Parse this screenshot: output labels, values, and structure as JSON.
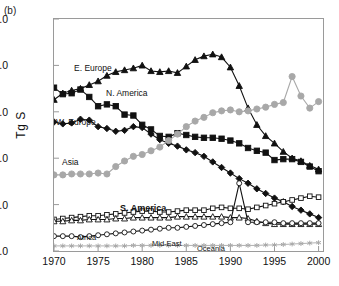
{
  "panel": {
    "label": "(b)"
  },
  "axes": {
    "ylabel": "Tg S",
    "xlabel": "",
    "yticks": [
      "0.0",
      "5.0",
      "10.0",
      "15.0",
      "20.0",
      "25.0"
    ],
    "xticks": [
      "1970",
      "1975",
      "1980",
      "1985",
      "1990",
      "1995",
      "2000"
    ]
  },
  "colors": {
    "black": "#111111",
    "gray": "#a8a8a8",
    "frame": "#9a9a9a",
    "white": "#ffffff"
  },
  "annotations": [
    {
      "text": "E. Europe",
      "x": 74,
      "y": 63
    },
    {
      "text": "N. America",
      "x": 106,
      "y": 88
    },
    {
      "text": "W. Europe",
      "x": 56,
      "y": 117
    },
    {
      "text": "Asia",
      "x": 62,
      "y": 157
    },
    {
      "text": "S. America",
      "x": 120,
      "y": 203
    },
    {
      "text": "Africa",
      "x": 77,
      "y": 233
    },
    {
      "text": "Mid-East",
      "x": 152,
      "y": 239
    },
    {
      "text": "Oceania",
      "x": 197,
      "y": 244
    }
  ],
  "chart_data": {
    "type": "line",
    "title": "",
    "xlabel": "",
    "ylabel": "Tg S",
    "xlim": [
      1970,
      2000.5
    ],
    "ylim": [
      0.0,
      25.0
    ],
    "grid": false,
    "legend": "inline-annotations",
    "x": [
      1970,
      1971,
      1972,
      1973,
      1974,
      1975,
      1976,
      1977,
      1978,
      1979,
      1980,
      1981,
      1982,
      1983,
      1984,
      1985,
      1986,
      1987,
      1988,
      1989,
      1990,
      1991,
      1992,
      1993,
      1994,
      1995,
      1996,
      1997,
      1998,
      1999,
      2000
    ],
    "series": [
      {
        "name": "E. Europe",
        "marker": "triangle",
        "color": "#111111",
        "fill": "#111111",
        "values": [
          16.3,
          17.0,
          17.3,
          17.5,
          17.9,
          18.3,
          18.9,
          19.3,
          19.5,
          19.7,
          20.0,
          19.4,
          19.3,
          19.4,
          19.2,
          19.9,
          20.6,
          21.0,
          21.2,
          20.9,
          19.8,
          17.8,
          15.4,
          13.6,
          12.4,
          11.6,
          10.7,
          10.0,
          9.7,
          9.2,
          8.8
        ]
      },
      {
        "name": "N. America",
        "marker": "square",
        "color": "#111111",
        "fill": "#111111",
        "values": [
          17.6,
          16.9,
          17.0,
          17.4,
          16.6,
          15.6,
          15.8,
          15.6,
          14.7,
          14.6,
          13.6,
          13.1,
          12.4,
          12.3,
          12.7,
          12.5,
          12.3,
          12.2,
          12.2,
          12.1,
          11.9,
          11.6,
          11.1,
          10.8,
          10.6,
          9.8,
          9.9,
          9.9,
          9.6,
          9.1,
          8.6
        ]
      },
      {
        "name": "W. Europe",
        "marker": "diamond",
        "color": "#111111",
        "fill": "#111111",
        "values": [
          13.9,
          13.7,
          13.8,
          14.2,
          14.1,
          13.4,
          13.2,
          12.9,
          13.0,
          13.4,
          13.3,
          12.6,
          12.0,
          11.6,
          11.3,
          10.9,
          10.6,
          10.2,
          9.6,
          9.0,
          8.4,
          7.8,
          7.3,
          6.7,
          6.2,
          5.7,
          5.3,
          4.8,
          4.4,
          4.0,
          3.6
        ]
      },
      {
        "name": "Asia",
        "marker": "circle",
        "color": "#a8a8a8",
        "fill": "#a8a8a8",
        "values": [
          8.2,
          8.2,
          8.3,
          8.3,
          8.3,
          8.4,
          8.3,
          9.1,
          9.7,
          10.2,
          10.4,
          10.8,
          11.2,
          11.9,
          12.6,
          13.4,
          14.0,
          14.4,
          14.9,
          15.1,
          15.2,
          15.0,
          15.1,
          15.3,
          15.5,
          15.8,
          16.0,
          18.8,
          16.7,
          15.4,
          16.1
        ]
      },
      {
        "name": "S. America",
        "marker": "square-open",
        "color": "#111111",
        "fill": "#ffffff",
        "values": [
          3.4,
          3.5,
          3.6,
          3.7,
          3.8,
          3.8,
          3.9,
          4.0,
          4.1,
          4.2,
          4.3,
          4.3,
          4.2,
          4.2,
          4.3,
          4.4,
          4.4,
          4.4,
          4.6,
          4.7,
          4.6,
          4.6,
          4.5,
          4.7,
          4.9,
          5.1,
          5.3,
          5.5,
          5.7,
          5.9,
          5.8
        ]
      },
      {
        "name": "Africa",
        "marker": "triangle-open",
        "color": "#111111",
        "fill": "#ffffff",
        "values": [
          3.2,
          3.2,
          3.3,
          3.3,
          3.4,
          3.4,
          3.4,
          3.5,
          3.5,
          3.6,
          3.6,
          3.6,
          3.6,
          3.6,
          3.7,
          3.7,
          3.7,
          3.7,
          3.7,
          3.7,
          3.6,
          3.6,
          3.5,
          3.2,
          3.0,
          2.9,
          2.9,
          2.9,
          2.9,
          2.9,
          2.9
        ]
      },
      {
        "name": "Mid-East",
        "marker": "circle-open",
        "color": "#111111",
        "fill": "#ffffff",
        "values": [
          1.6,
          1.6,
          1.6,
          1.5,
          1.6,
          1.7,
          1.8,
          1.9,
          2.0,
          2.1,
          2.2,
          2.3,
          2.4,
          2.5,
          2.5,
          2.6,
          2.7,
          2.8,
          2.9,
          3.0,
          3.1,
          7.3,
          3.1,
          3.1,
          3.1,
          3.1,
          3.0,
          3.0,
          3.0,
          3.0,
          3.0
        ]
      },
      {
        "name": "Oceania",
        "marker": "asterisk",
        "color": "#a8a8a8",
        "fill": "#a8a8a8",
        "values": [
          0.55,
          0.55,
          0.55,
          0.55,
          0.55,
          0.55,
          0.55,
          0.55,
          0.55,
          0.6,
          0.6,
          0.6,
          0.6,
          0.6,
          0.6,
          0.6,
          0.6,
          0.6,
          0.6,
          0.6,
          0.6,
          0.6,
          0.6,
          0.6,
          0.65,
          0.65,
          0.7,
          0.75,
          0.8,
          0.85,
          0.9
        ]
      }
    ]
  }
}
